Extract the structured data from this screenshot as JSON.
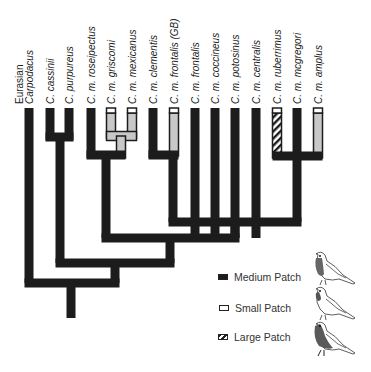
{
  "diagram": {
    "type": "phylogenetic-tree",
    "colors": {
      "medium": "#1c1c1c",
      "small_fill": "#c8c8c8",
      "outline": "#1c1c1c",
      "hatch_light": "#ffffff"
    },
    "leaves": [
      {
        "id": "eurasian",
        "line1": "Eurasian",
        "line2": "Carpodacus",
        "state": "medium",
        "italic_line2": true
      },
      {
        "id": "cassinii",
        "label": "C. cassinii",
        "state": "medium"
      },
      {
        "id": "purpureus",
        "label": "C. purpureus",
        "state": "medium"
      },
      {
        "id": "roseipectus",
        "label": "C. m. roseipectus",
        "state": "medium"
      },
      {
        "id": "griscomi",
        "label": "C. m. griscomi",
        "state": "small"
      },
      {
        "id": "mexicanus",
        "label": "C. m. mexicanus",
        "state": "small"
      },
      {
        "id": "clementis",
        "label": "C. m. clementis",
        "state": "medium"
      },
      {
        "id": "frontalis_gb",
        "label": "C. m. frontalis (GB)",
        "state": "small"
      },
      {
        "id": "frontalis",
        "label": "C. m. frontalis",
        "state": "medium"
      },
      {
        "id": "coccineus",
        "label": "C. m. coccineus",
        "state": "medium"
      },
      {
        "id": "potosinus",
        "label": "C. m. potosinus",
        "state": "medium"
      },
      {
        "id": "centralis",
        "label": "C. m. centralis",
        "state": "medium"
      },
      {
        "id": "ruberrimus",
        "label": "C. m. ruberrimus",
        "state": "large"
      },
      {
        "id": "mcgregori",
        "label": "C. m. mcgregori",
        "state": "medium"
      },
      {
        "id": "amplus",
        "label": "C. m. amplus",
        "state": "small"
      }
    ],
    "legend": [
      {
        "key": "medium",
        "label": "Medium Patch",
        "icon": "bird-medium-patch-icon"
      },
      {
        "key": "small",
        "label": "Small Patch",
        "icon": "bird-small-patch-icon"
      },
      {
        "key": "large",
        "label": "Large Patch",
        "icon": "bird-large-patch-icon"
      }
    ]
  }
}
